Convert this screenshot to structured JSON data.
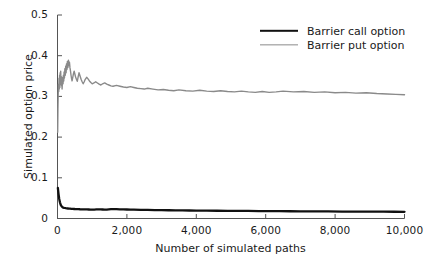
{
  "chart_data": {
    "type": "line",
    "title": "",
    "xlabel": "Number of simulated paths",
    "ylabel": "Simulated option price",
    "xlim": [
      0,
      10000
    ],
    "ylim": [
      0,
      0.5
    ],
    "grid": false,
    "legend_position": "top-right",
    "xticks": [
      0,
      2000,
      4000,
      6000,
      8000,
      10000
    ],
    "xtick_labels": [
      "0",
      "2,000",
      "4,000",
      "6,000",
      "8,000",
      "10,000"
    ],
    "yticks": [
      0,
      0.1,
      0.2,
      0.3,
      0.4,
      0.5
    ],
    "ytick_labels": [
      "0",
      "0.1",
      "0.2",
      "0.3",
      "0.4",
      "0.5"
    ],
    "series": [
      {
        "name": "Barrier call option",
        "color": "#111111",
        "width": 2.3,
        "x": [
          10,
          30,
          50,
          70,
          90,
          110,
          130,
          150,
          170,
          190,
          210,
          240,
          270,
          300,
          330,
          360,
          400,
          440,
          480,
          520,
          560,
          600,
          650,
          700,
          750,
          800,
          850,
          900,
          950,
          1000,
          1060,
          1120,
          1180,
          1240,
          1300,
          1360,
          1420,
          1480,
          1540,
          1600,
          1700,
          1800,
          1900,
          2000,
          2100,
          2200,
          2400,
          2600,
          2800,
          3000,
          3200,
          3400,
          3600,
          3800,
          4000,
          4300,
          4600,
          4900,
          5200,
          5500,
          5800,
          6100,
          6400,
          6700,
          7000,
          7400,
          7800,
          8200,
          8600,
          9000,
          9400,
          9700,
          10000
        ],
        "y": [
          0.075,
          0.06,
          0.048,
          0.04,
          0.034,
          0.031,
          0.029,
          0.0275,
          0.0268,
          0.0262,
          0.0258,
          0.0252,
          0.0248,
          0.0246,
          0.0244,
          0.0242,
          0.0238,
          0.0236,
          0.0234,
          0.0232,
          0.0231,
          0.0229,
          0.0227,
          0.0226,
          0.0225,
          0.0224,
          0.0222,
          0.0221,
          0.022,
          0.0219,
          0.022,
          0.0222,
          0.0224,
          0.0223,
          0.0221,
          0.0219,
          0.022,
          0.0226,
          0.0231,
          0.0232,
          0.0229,
          0.0226,
          0.0223,
          0.0221,
          0.0219,
          0.0217,
          0.0214,
          0.0211,
          0.0208,
          0.0206,
          0.0203,
          0.0201,
          0.0199,
          0.0197,
          0.0195,
          0.0193,
          0.0191,
          0.0189,
          0.0187,
          0.0185,
          0.0183,
          0.0181,
          0.018,
          0.0178,
          0.0177,
          0.0175,
          0.0173,
          0.0171,
          0.017,
          0.0168,
          0.0167,
          0.0166,
          0.0165
        ]
      },
      {
        "name": "Barrier put option",
        "color": "#8a8a8a",
        "width": 1.4,
        "x": [
          5,
          12,
          20,
          28,
          36,
          44,
          52,
          60,
          68,
          76,
          84,
          92,
          100,
          108,
          116,
          124,
          132,
          140,
          150,
          160,
          170,
          180,
          190,
          200,
          212,
          224,
          236,
          248,
          260,
          272,
          285,
          300,
          315,
          330,
          345,
          360,
          375,
          390,
          405,
          420,
          440,
          460,
          480,
          500,
          520,
          545,
          570,
          595,
          620,
          650,
          680,
          710,
          740,
          770,
          800,
          840,
          880,
          920,
          960,
          1000,
          1050,
          1100,
          1150,
          1200,
          1250,
          1300,
          1360,
          1420,
          1480,
          1540,
          1600,
          1700,
          1800,
          1900,
          2000,
          2100,
          2200,
          2300,
          2400,
          2500,
          2600,
          2750,
          2900,
          3050,
          3200,
          3350,
          3500,
          3700,
          3900,
          4100,
          4300,
          4500,
          4700,
          4900,
          5100,
          5300,
          5500,
          5700,
          5900,
          6100,
          6300,
          6500,
          6800,
          7100,
          7400,
          7700,
          8000,
          8300,
          8600,
          8900,
          9200,
          9500,
          9750,
          10000
        ],
        "y": [
          0.212,
          0.268,
          0.305,
          0.33,
          0.312,
          0.345,
          0.318,
          0.352,
          0.322,
          0.358,
          0.33,
          0.362,
          0.335,
          0.349,
          0.326,
          0.34,
          0.318,
          0.332,
          0.347,
          0.331,
          0.352,
          0.338,
          0.36,
          0.345,
          0.368,
          0.352,
          0.374,
          0.358,
          0.38,
          0.366,
          0.386,
          0.371,
          0.389,
          0.376,
          0.384,
          0.37,
          0.362,
          0.352,
          0.344,
          0.338,
          0.347,
          0.356,
          0.362,
          0.355,
          0.348,
          0.342,
          0.337,
          0.348,
          0.358,
          0.35,
          0.342,
          0.336,
          0.331,
          0.336,
          0.342,
          0.347,
          0.343,
          0.338,
          0.334,
          0.331,
          0.333,
          0.336,
          0.333,
          0.33,
          0.328,
          0.331,
          0.333,
          0.33,
          0.328,
          0.326,
          0.325,
          0.327,
          0.325,
          0.323,
          0.322,
          0.324,
          0.322,
          0.32,
          0.319,
          0.318,
          0.32,
          0.318,
          0.316,
          0.317,
          0.315,
          0.314,
          0.316,
          0.314,
          0.313,
          0.315,
          0.313,
          0.312,
          0.314,
          0.312,
          0.311,
          0.313,
          0.311,
          0.31,
          0.312,
          0.31,
          0.311,
          0.313,
          0.311,
          0.312,
          0.31,
          0.311,
          0.309,
          0.31,
          0.308,
          0.309,
          0.307,
          0.306,
          0.305,
          0.304
        ]
      }
    ]
  },
  "axes": {
    "ylabel": "Simulated option price",
    "xlabel": "Number of simulated paths",
    "ytick_labels": [
      "0.5",
      "0.4",
      "0.3",
      "0.2",
      "0.1",
      "0"
    ],
    "xtick_labels": [
      "0",
      "2,000",
      "4,000",
      "6,000",
      "8,000",
      "10,000"
    ]
  },
  "legend": {
    "items": [
      {
        "label": "Barrier call option",
        "color": "#111111"
      },
      {
        "label": "Barrier put option",
        "color": "#8a8a8a"
      }
    ]
  }
}
